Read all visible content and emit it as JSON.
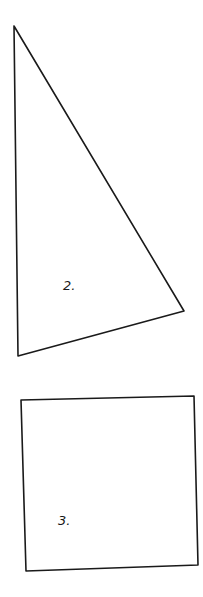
{
  "figures": [
    {
      "id": "shape-2",
      "type": "triangle",
      "label": "2.",
      "points": "14,26 18,356 184,311",
      "label_pos": {
        "x": 63,
        "y": 290
      }
    },
    {
      "id": "shape-3",
      "type": "quadrilateral",
      "label": "3.",
      "points": "21,400 194,396 198,565 26,571",
      "label_pos": {
        "x": 58,
        "y": 525
      }
    }
  ],
  "colors": {
    "stroke": "#1a1a1a",
    "background": "#ffffff"
  }
}
